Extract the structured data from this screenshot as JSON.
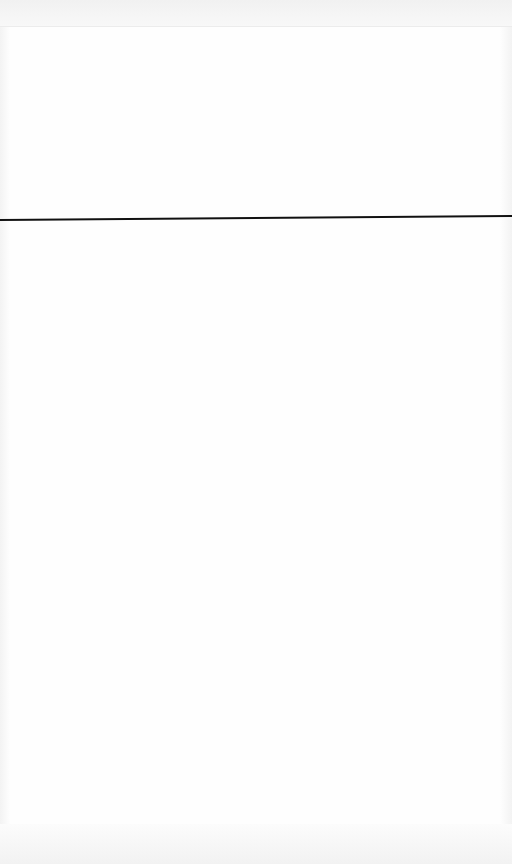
{
  "page": {
    "background_color": "#fdfdfd",
    "divider": {
      "color": "#111111",
      "y_left": 222,
      "y_right": 218
    }
  }
}
